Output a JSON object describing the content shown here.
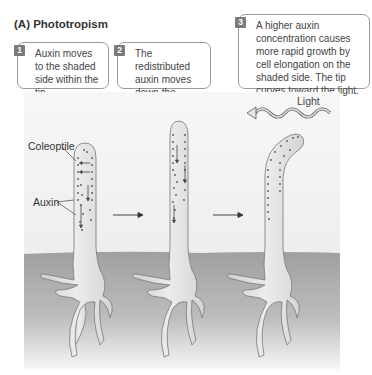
{
  "figure": {
    "title": "(A)  Phototropism",
    "steps": [
      {
        "num": "1",
        "text": "Auxin moves to the shaded side within the tip."
      },
      {
        "num": "2",
        "text": "The redistributed auxin moves down the coleoptile."
      },
      {
        "num": "3",
        "text": "A higher auxin concentration causes more rapid growth by cell elongation on the shaded side. The tip curves toward the light."
      }
    ],
    "labels": {
      "coleoptile": "Coleoptile",
      "auxin": "Auxin",
      "light": "Light"
    },
    "colors": {
      "background_panel": "#f3f3f3",
      "soil_top": "#a3a3a3",
      "soil_bottom": "#f5f5f5",
      "plant_fill": "#e0e0e0",
      "outline": "#777777",
      "step_badge": "#7a7a7a"
    }
  }
}
